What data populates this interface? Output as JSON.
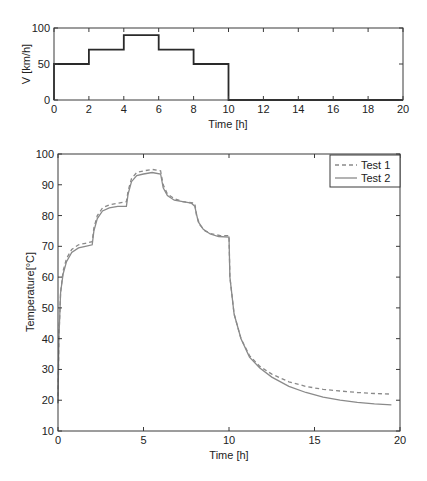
{
  "chart_data": [
    {
      "type": "line",
      "title": "",
      "xlabel": "Time [h]",
      "ylabel": "V [km/h]",
      "xlim": [
        0,
        20
      ],
      "ylim": [
        0,
        100
      ],
      "xticks": [
        0,
        2,
        4,
        6,
        8,
        10,
        12,
        14,
        16,
        18,
        20
      ],
      "yticks": [
        0,
        50,
        100
      ],
      "grid": false,
      "series": [
        {
          "name": "Speed profile",
          "style": "step",
          "x": [
            0,
            0,
            2,
            2,
            4,
            4,
            6,
            6,
            8,
            8,
            10,
            10,
            20
          ],
          "y": [
            0,
            50,
            50,
            70,
            70,
            90,
            90,
            70,
            70,
            50,
            50,
            0,
            0
          ]
        }
      ]
    },
    {
      "type": "line",
      "title": "",
      "xlabel": "Time [h]",
      "ylabel": "Temperature[°C]",
      "xlim": [
        0,
        20
      ],
      "ylim": [
        10,
        100
      ],
      "xticks": [
        0,
        5,
        10,
        15,
        20
      ],
      "yticks": [
        10,
        20,
        30,
        40,
        50,
        60,
        70,
        80,
        90,
        100
      ],
      "grid": false,
      "legend": {
        "placement": "top-right",
        "entries": [
          "Test 1",
          "Test 2"
        ]
      },
      "series": [
        {
          "name": "Test 1",
          "style": "dashed",
          "x": [
            0,
            0.05,
            0.15,
            0.3,
            0.5,
            0.8,
            1.2,
            1.6,
            2.0,
            2.1,
            2.3,
            2.6,
            3.0,
            3.5,
            4.0,
            4.1,
            4.3,
            4.6,
            5.0,
            5.5,
            6.0,
            6.15,
            6.4,
            6.8,
            7.3,
            8.0,
            8.1,
            8.3,
            8.6,
            9.0,
            9.5,
            10.0,
            10.05,
            10.3,
            10.7,
            11.2,
            11.8,
            12.5,
            13.5,
            14.5,
            15.5,
            16.5,
            17.5,
            18.5,
            19.5
          ],
          "y": [
            19,
            40,
            55,
            62,
            66,
            69,
            70.5,
            71,
            71.5,
            76,
            80,
            82.5,
            83.5,
            84,
            84.5,
            88,
            92,
            94,
            94.5,
            95,
            94.5,
            90,
            87,
            85.5,
            84.5,
            84,
            80,
            77,
            75,
            74,
            73.5,
            73.5,
            60,
            48,
            40,
            34.5,
            31,
            28.5,
            26,
            24.5,
            23.5,
            23,
            22.5,
            22.2,
            22
          ]
        },
        {
          "name": "Test 2",
          "style": "solid",
          "x": [
            0,
            0.05,
            0.15,
            0.3,
            0.5,
            0.8,
            1.2,
            1.6,
            2.0,
            2.1,
            2.3,
            2.6,
            3.0,
            3.5,
            4.0,
            4.1,
            4.3,
            4.6,
            5.0,
            5.5,
            6.0,
            6.15,
            6.4,
            6.8,
            7.3,
            7.8,
            8.0,
            8.2,
            8.5,
            8.9,
            9.4,
            10.0,
            10.05,
            10.3,
            10.7,
            11.2,
            11.8,
            12.5,
            13.5,
            14.5,
            15.5,
            16.5,
            17.5,
            18.5,
            19.5
          ],
          "y": [
            19,
            40,
            55,
            61,
            65,
            68,
            69.5,
            70,
            70.5,
            75,
            79,
            81.5,
            82.5,
            83,
            83,
            87,
            91,
            93,
            93.5,
            94,
            93.5,
            89,
            86.5,
            85,
            84.5,
            84,
            83,
            78,
            75.5,
            74,
            73.2,
            73,
            60,
            48,
            40,
            34,
            30.5,
            27.5,
            24.5,
            22.5,
            21,
            20,
            19.3,
            18.8,
            18.5
          ]
        }
      ]
    }
  ]
}
